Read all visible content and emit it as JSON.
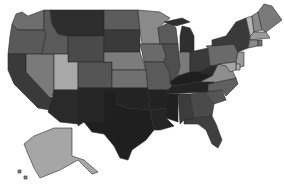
{
  "map": {
    "type": "choropleth",
    "region": "United States",
    "colormap": "grayscale",
    "background": "#ffffff",
    "border_color": "#2a2a2a",
    "states": [
      {
        "id": "WA",
        "name": "Washington",
        "fill": "#6e6e6e"
      },
      {
        "id": "OR",
        "name": "Oregon",
        "fill": "#595959"
      },
      {
        "id": "CA",
        "name": "California",
        "fill": "#3a3a3a"
      },
      {
        "id": "NV",
        "name": "Nevada",
        "fill": "#7a7a7a"
      },
      {
        "id": "ID",
        "name": "Idaho",
        "fill": "#5a5a5a"
      },
      {
        "id": "MT",
        "name": "Montana",
        "fill": "#2e2e2e"
      },
      {
        "id": "WY",
        "name": "Wyoming",
        "fill": "#4a4a4a"
      },
      {
        "id": "UT",
        "name": "Utah",
        "fill": "#a8a8a8"
      },
      {
        "id": "AZ",
        "name": "Arizona",
        "fill": "#2a2a2a"
      },
      {
        "id": "CO",
        "name": "Colorado",
        "fill": "#555555"
      },
      {
        "id": "NM",
        "name": "New Mexico",
        "fill": "#262626"
      },
      {
        "id": "ND",
        "name": "North Dakota",
        "fill": "#5c5c5c"
      },
      {
        "id": "SD",
        "name": "South Dakota",
        "fill": "#3a3a3a"
      },
      {
        "id": "NE",
        "name": "Nebraska",
        "fill": "#7c7c7c"
      },
      {
        "id": "KS",
        "name": "Kansas",
        "fill": "#707070"
      },
      {
        "id": "OK",
        "name": "Oklahoma",
        "fill": "#232323"
      },
      {
        "id": "TX",
        "name": "Texas",
        "fill": "#1f1f1f"
      },
      {
        "id": "MN",
        "name": "Minnesota",
        "fill": "#8a8a8a"
      },
      {
        "id": "IA",
        "name": "Iowa",
        "fill": "#6a6a6a"
      },
      {
        "id": "MO",
        "name": "Missouri",
        "fill": "#5a5a5a"
      },
      {
        "id": "AR",
        "name": "Arkansas",
        "fill": "#222222"
      },
      {
        "id": "LA",
        "name": "Louisiana",
        "fill": "#252525"
      },
      {
        "id": "WI",
        "name": "Wisconsin",
        "fill": "#5a5a5a"
      },
      {
        "id": "IL",
        "name": "Illinois",
        "fill": "#4e4e4e"
      },
      {
        "id": "MI",
        "name": "Michigan",
        "fill": "#2f2f2f"
      },
      {
        "id": "IN",
        "name": "Indiana",
        "fill": "#7a7a7a"
      },
      {
        "id": "OH",
        "name": "Ohio",
        "fill": "#3a3a3a"
      },
      {
        "id": "KY",
        "name": "Kentucky",
        "fill": "#1e1e1e"
      },
      {
        "id": "TN",
        "name": "Tennessee",
        "fill": "#242424"
      },
      {
        "id": "MS",
        "name": "Mississippi",
        "fill": "#202020"
      },
      {
        "id": "AL",
        "name": "Alabama",
        "fill": "#3c3c3c"
      },
      {
        "id": "GA",
        "name": "Georgia",
        "fill": "#4a4a4a"
      },
      {
        "id": "FL",
        "name": "Florida",
        "fill": "#3f3f3f"
      },
      {
        "id": "SC",
        "name": "South Carolina",
        "fill": "#555555"
      },
      {
        "id": "NC",
        "name": "North Carolina",
        "fill": "#606060"
      },
      {
        "id": "VA",
        "name": "Virginia",
        "fill": "#8e8e8e"
      },
      {
        "id": "WV",
        "name": "West Virginia",
        "fill": "#2a2a2a"
      },
      {
        "id": "PA",
        "name": "Pennsylvania",
        "fill": "#6a6a6a"
      },
      {
        "id": "NY",
        "name": "New York",
        "fill": "#3a3a3a"
      },
      {
        "id": "NJ",
        "name": "New Jersey",
        "fill": "#9a9a9a"
      },
      {
        "id": "DE",
        "name": "Delaware",
        "fill": "#b0b0b0"
      },
      {
        "id": "MD",
        "name": "Maryland",
        "fill": "#a5a5a5"
      },
      {
        "id": "VT",
        "name": "Vermont",
        "fill": "#b5b5b5"
      },
      {
        "id": "NH",
        "name": "New Hampshire",
        "fill": "#8a8a8a"
      },
      {
        "id": "ME",
        "name": "Maine",
        "fill": "#7a7a7a"
      },
      {
        "id": "MA",
        "name": "Massachusetts",
        "fill": "#9a9a9a"
      },
      {
        "id": "CT",
        "name": "Connecticut",
        "fill": "#8a8a8a"
      },
      {
        "id": "RI",
        "name": "Rhode Island",
        "fill": "#707070"
      },
      {
        "id": "AK",
        "name": "Alaska",
        "fill": "#a6a6a6"
      },
      {
        "id": "HI",
        "name": "Hawaii",
        "fill": "#8a8a8a"
      }
    ]
  }
}
